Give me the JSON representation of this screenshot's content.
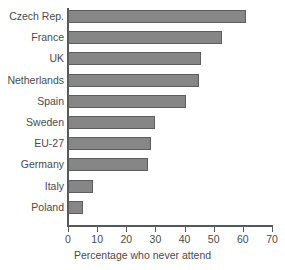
{
  "chart_data": {
    "type": "bar",
    "orientation": "horizontal",
    "title": "",
    "xlabel": "Percentage who never attend",
    "ylabel": "",
    "xlim": [
      0,
      70
    ],
    "xticks": [
      0,
      10,
      20,
      30,
      40,
      50,
      60,
      70
    ],
    "grid": false,
    "legend": false,
    "bar_color": "#868686",
    "bar_border_color": "#5d5d5d",
    "axis_color": "#55595c",
    "text_color": "#4a4a4a",
    "categories": [
      "Czech Rep.",
      "France",
      "UK",
      "Netherlands",
      "Spain",
      "Sweden",
      "EU-27",
      "Germany",
      "Italy",
      "Poland"
    ],
    "values": [
      61,
      53,
      45.5,
      45,
      40.5,
      30,
      28.5,
      27.5,
      8.5,
      5
    ]
  }
}
